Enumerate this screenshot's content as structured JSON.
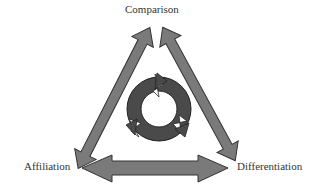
{
  "diagram": {
    "labels": {
      "top": "Comparison",
      "left": "Affiliation",
      "right": "Differentiation"
    },
    "colors": {
      "arrow_fill": "#7a7a7a",
      "arrow_stroke": "#333333",
      "cycle_fill": "#4a4a4a",
      "text": "#333333"
    },
    "edges": [
      {
        "from": "Comparison",
        "to": "Affiliation",
        "type": "double-arrow"
      },
      {
        "from": "Comparison",
        "to": "Differentiation",
        "type": "double-arrow"
      },
      {
        "from": "Affiliation",
        "to": "Differentiation",
        "type": "double-arrow"
      }
    ],
    "center": {
      "icon": "cycle-icon",
      "segments": 3
    }
  }
}
